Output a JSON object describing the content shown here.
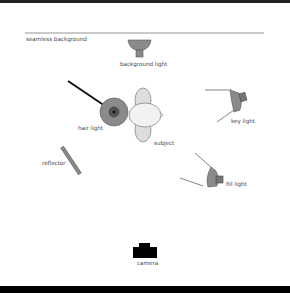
{
  "diagram": {
    "labels": {
      "seamless_background": "seamless background",
      "background_light": "background light",
      "hair_light": "hair light",
      "key_light": "key light",
      "subject": "subject",
      "reflector": "reflector",
      "fill_light": "fill light",
      "camera": "camera"
    },
    "colors": {
      "light_fill": "#8a8a8a",
      "light_stroke": "#555555",
      "subject_fill": "#e8e8e8",
      "camera": "#000000",
      "line": "#333333",
      "frame": "#111111"
    }
  }
}
